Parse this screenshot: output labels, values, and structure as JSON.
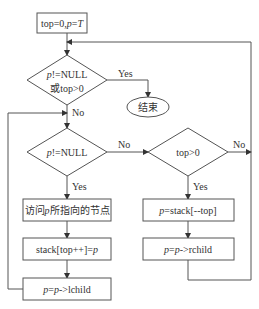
{
  "diagram": {
    "type": "flowchart",
    "title": "",
    "nodes": {
      "start": {
        "kind": "process",
        "text_parts": [
          {
            "t": "top=0,"
          },
          {
            "t": "p",
            "i": true
          },
          {
            "t": "="
          },
          {
            "t": "T",
            "i": true
          }
        ]
      },
      "cond_outer": {
        "kind": "decision",
        "line1": [
          {
            "t": "p",
            "i": true
          },
          {
            "t": "!=NULL"
          }
        ],
        "line2": [
          {
            "t": "或top>0"
          }
        ]
      },
      "end": {
        "kind": "terminal",
        "text_parts": [
          {
            "t": "结束"
          }
        ]
      },
      "cond_p": {
        "kind": "decision",
        "line1": [
          {
            "t": "p",
            "i": true
          },
          {
            "t": "!=NULL"
          }
        ]
      },
      "cond_top": {
        "kind": "decision",
        "line1": [
          {
            "t": "top>0"
          }
        ]
      },
      "visit": {
        "kind": "process",
        "text_parts": [
          {
            "t": "访问"
          },
          {
            "t": "p",
            "i": true
          },
          {
            "t": "所指向的节点"
          }
        ]
      },
      "push": {
        "kind": "process",
        "text_parts": [
          {
            "t": "stack[top++]="
          },
          {
            "t": "p",
            "i": true
          }
        ]
      },
      "go_left": {
        "kind": "process",
        "text_parts": [
          {
            "t": "p",
            "i": true
          },
          {
            "t": "="
          },
          {
            "t": "p",
            "i": true
          },
          {
            "t": "->lchild"
          }
        ]
      },
      "pop": {
        "kind": "process",
        "text_parts": [
          {
            "t": "p",
            "i": true
          },
          {
            "t": "=stack[--top]"
          }
        ]
      },
      "go_right": {
        "kind": "process",
        "text_parts": [
          {
            "t": "p",
            "i": true
          },
          {
            "t": "="
          },
          {
            "t": "p",
            "i": true
          },
          {
            "t": "->rchild"
          }
        ]
      }
    },
    "edges": [
      {
        "from": "start",
        "to": "cond_outer",
        "label": ""
      },
      {
        "from": "cond_outer",
        "to": "end",
        "label": "Yes"
      },
      {
        "from": "cond_outer",
        "to": "cond_p",
        "label": "No"
      },
      {
        "from": "cond_p",
        "to": "visit",
        "label": "Yes"
      },
      {
        "from": "cond_p",
        "to": "cond_top",
        "label": "No"
      },
      {
        "from": "cond_top",
        "to": "pop",
        "label": "Yes"
      },
      {
        "from": "cond_top",
        "to": "cond_outer",
        "label": "No"
      },
      {
        "from": "visit",
        "to": "push",
        "label": ""
      },
      {
        "from": "push",
        "to": "go_left",
        "label": ""
      },
      {
        "from": "go_left",
        "to": "cond_p",
        "label": ""
      },
      {
        "from": "pop",
        "to": "go_right",
        "label": ""
      },
      {
        "from": "go_right",
        "to": "cond_outer",
        "label": ""
      }
    ],
    "edge_labels": {
      "yes": "Yes",
      "no": "No"
    }
  }
}
